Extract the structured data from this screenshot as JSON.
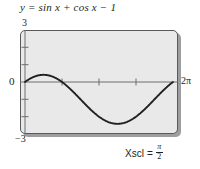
{
  "figure": {
    "title": "y = sin x + cos x − 1",
    "xscl_label": "Xscl",
    "xscl_equals": "=",
    "xscl_numerator": "π",
    "xscl_denominator": "2"
  },
  "axis_labels": {
    "y_max": "3",
    "y_min": "−3",
    "y_zero": "0",
    "x_max": "2π"
  },
  "colors": {
    "plot_background": "#e9e9e9",
    "frame_border": "#58595b",
    "curve": "#231f20",
    "axis": "#6d6e70",
    "text": "#231f20",
    "shadow": "#9c9ea0"
  },
  "chart_data": {
    "type": "line",
    "title": "y = sin x + cos x − 1",
    "xlabel": "",
    "ylabel": "",
    "xlim": [
      0,
      6.283185307179586
    ],
    "ylim": [
      -3,
      3
    ],
    "xtick_labels": [
      "0",
      "2π"
    ],
    "ytick_labels": [
      "3",
      "0",
      "−3"
    ],
    "x_tick_spacing": "π/2",
    "y_tick_spacing": 1,
    "grid": false,
    "legend": null,
    "annotations": [
      "Xscl = π/2"
    ],
    "series": [
      {
        "name": "y = sin x + cos x − 1",
        "x": [
          0.0,
          0.1963,
          0.3927,
          0.589,
          0.7854,
          0.9817,
          1.1781,
          1.3744,
          1.5708,
          1.7671,
          1.9635,
          2.1598,
          2.3562,
          2.5525,
          2.7489,
          2.9452,
          3.1416,
          3.3379,
          3.5343,
          3.7306,
          3.927,
          4.1233,
          4.3197,
          4.516,
          4.7124,
          4.9087,
          5.1051,
          5.3014,
          5.4978,
          5.6941,
          5.8905,
          6.0868,
          6.2832
        ],
        "y": [
          0.0,
          0.1756,
          0.3066,
          0.3873,
          0.4142,
          0.3873,
          0.3066,
          0.1756,
          0.0,
          -0.2131,
          -0.4562,
          -0.7236,
          -1.0,
          -1.3087,
          -1.6088,
          -1.8946,
          -2.0,
          -2.3066,
          -2.4562,
          -2.5664,
          -2.4142,
          -2.6088,
          -2.5664,
          -2.4562,
          -2.4142,
          -2.1756,
          -1.8946,
          -1.6088,
          -1.2764,
          -0.9444,
          -0.6088,
          -0.3066,
          0.0
        ],
        "max_y": 0.4142,
        "max_x": 0.7854,
        "min_y": -2.4142,
        "min_x": 3.927,
        "zero_crossings": [
          0.0,
          1.5708,
          6.2832
        ]
      }
    ]
  }
}
